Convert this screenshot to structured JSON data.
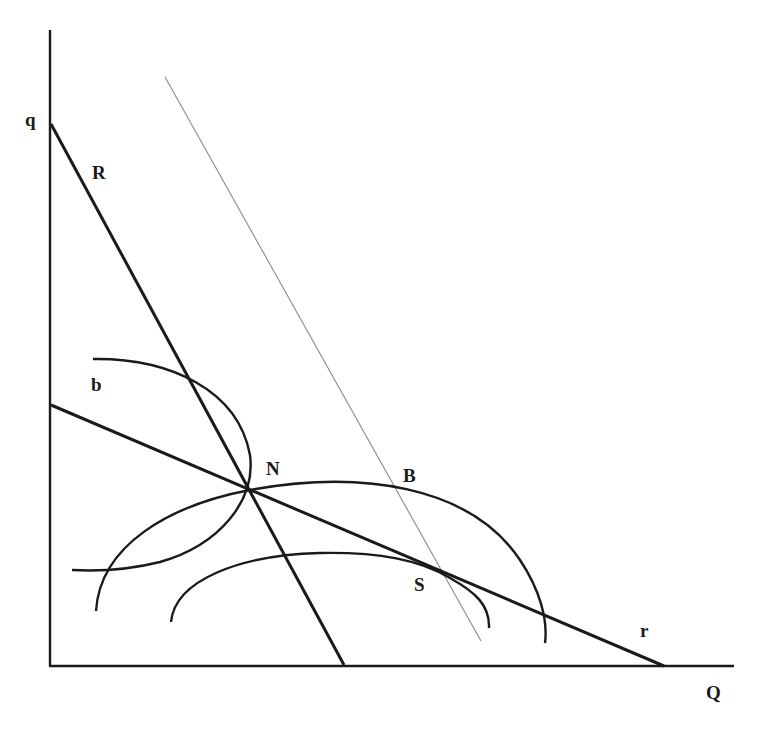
{
  "diagram": {
    "title": "",
    "colors": {
      "ink": "#1a1a1a",
      "thin_line": "#8a8a8a",
      "background": "#ffffff"
    },
    "axes": {
      "vertical": {
        "x1": 50,
        "y1": 30,
        "x2": 50,
        "y2": 666
      },
      "horizontal": {
        "x1": 49,
        "y1": 666,
        "x2": 734,
        "y2": 666
      }
    },
    "labels": {
      "q": "q",
      "R": "R",
      "b": "b",
      "N": "N",
      "B": "B",
      "S": "S",
      "r": "r",
      "Q": "Q"
    },
    "lines": {
      "R": {
        "x1": 51,
        "y1": 124,
        "x2": 344,
        "y2": 665
      },
      "r": {
        "x1": 51,
        "y1": 405,
        "x2": 664,
        "y2": 666
      },
      "budget_thin": {
        "x1": 165,
        "y1": 77,
        "x2": 481,
        "y2": 641
      }
    },
    "curves": {
      "b": "M 93 359 C 170 358, 238 390, 250 455 C 256 500, 220 545, 160 562 C 120 572, 90 571, 72 570",
      "N_arc": "M 96 611 C 100 545, 170 505, 250 490 C 360 470, 470 485, 520 560 C 540 590, 548 620, 545 643",
      "S_arc": "M 171 622 C 175 580, 240 555, 320 553 C 380 552, 420 560, 450 578 C 475 592, 490 605, 489 628"
    }
  }
}
